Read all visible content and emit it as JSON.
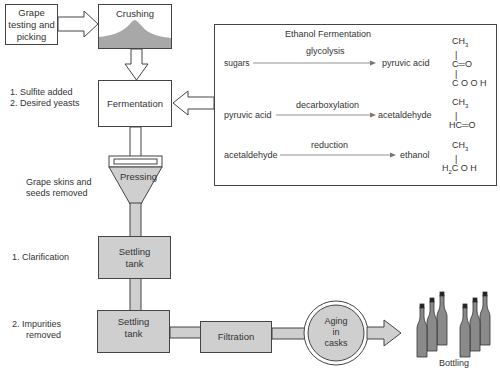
{
  "steps": {
    "grape": "Grape testing and picking",
    "grape_lines": [
      "Grape",
      "testing and",
      "picking"
    ],
    "crushing": "Crushing",
    "fermentation": "Fermentation",
    "pressing": "Pressing",
    "settling1_lines": [
      "Settling",
      "tank"
    ],
    "settling2_lines": [
      "Settling",
      "tank"
    ],
    "filtration": "Filtration",
    "aging_lines": [
      "Aging",
      "in",
      "casks"
    ],
    "bottling": "Bottling"
  },
  "notes": {
    "fermentation_inputs": [
      "1.  Sulfite added",
      "2.  Desired yeasts"
    ],
    "pressing_note": [
      "Grape skins and",
      "seeds removed"
    ],
    "settling1_note": "1.  Clarification",
    "settling2_note": [
      "2.  Impurities",
      "removed"
    ]
  },
  "ethanol_box": {
    "title": "Ethanol Fermentation",
    "reactions": [
      {
        "substrate": "sugars",
        "process": "glycolysis",
        "product": "pyruvic acid",
        "formula": [
          "CH3",
          "|",
          "C=O",
          "|",
          "COOH"
        ]
      },
      {
        "substrate": "pyruvic acid",
        "process": "decarboxylation",
        "product": "acetaldehyde",
        "formula": [
          "CH3",
          "|",
          "HC=O"
        ]
      },
      {
        "substrate": "acetaldehyde",
        "process": "reduction",
        "product": "ethanol",
        "formula": [
          "CH3",
          "|",
          "H2COH"
        ]
      }
    ]
  },
  "colors": {
    "box_fill_gray": "#cfcfcf",
    "line": "#444444",
    "text": "#333333",
    "sediment": "#1a1a1a",
    "bottle": "#8a8a8a"
  }
}
